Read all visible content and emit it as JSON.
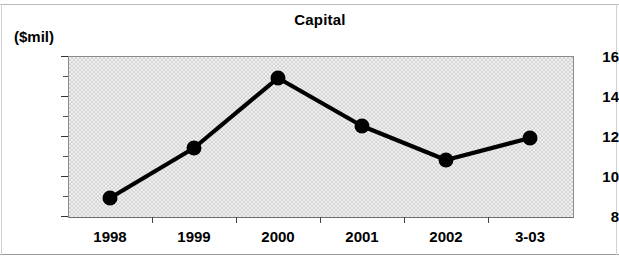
{
  "chart_data": {
    "type": "line",
    "title": "Capital",
    "xlabel": "",
    "ylabel": "($mil)",
    "categories": [
      "1998",
      "1999",
      "2000",
      "2001",
      "2002",
      "3-03"
    ],
    "values": [
      8.9,
      11.4,
      14.9,
      12.5,
      10.8,
      11.9
    ],
    "series": [
      {
        "name": "Capital",
        "values": [
          8.9,
          11.4,
          14.9,
          12.5,
          10.8,
          11.9
        ]
      }
    ],
    "ylim": [
      8,
      16
    ],
    "ytick_labels": [
      "8",
      "10",
      "12",
      "14",
      "16"
    ],
    "ytick_values": [
      8,
      10,
      12,
      14,
      16
    ],
    "yminor_values": [
      9,
      11,
      13,
      15
    ],
    "grid": false,
    "legend": "none",
    "marker": "filled-circle",
    "line_color": "#000000",
    "marker_color": "#000000",
    "plot_background": "#e2e2e2"
  },
  "figure": {
    "title": "Capital",
    "unit_label": "($mil)"
  }
}
